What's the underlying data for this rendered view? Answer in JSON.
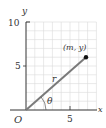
{
  "diagram": {
    "type": "polar-coordinates",
    "axes": {
      "x_label": "x",
      "y_label": "y",
      "origin_label": "O",
      "x_ticks": [
        "5"
      ],
      "y_ticks": [
        "5",
        "10"
      ],
      "x_range": [
        0,
        8
      ],
      "y_range": [
        0,
        10
      ]
    },
    "point": {
      "label": "(m, y)",
      "x": 6.8,
      "y": 6.0
    },
    "radius_label": "r",
    "angle_label": "θ",
    "colors": {
      "grid": "#d8d8d8",
      "axis": "#333333",
      "segment": "#7a7a7a",
      "point": "#111111"
    }
  }
}
